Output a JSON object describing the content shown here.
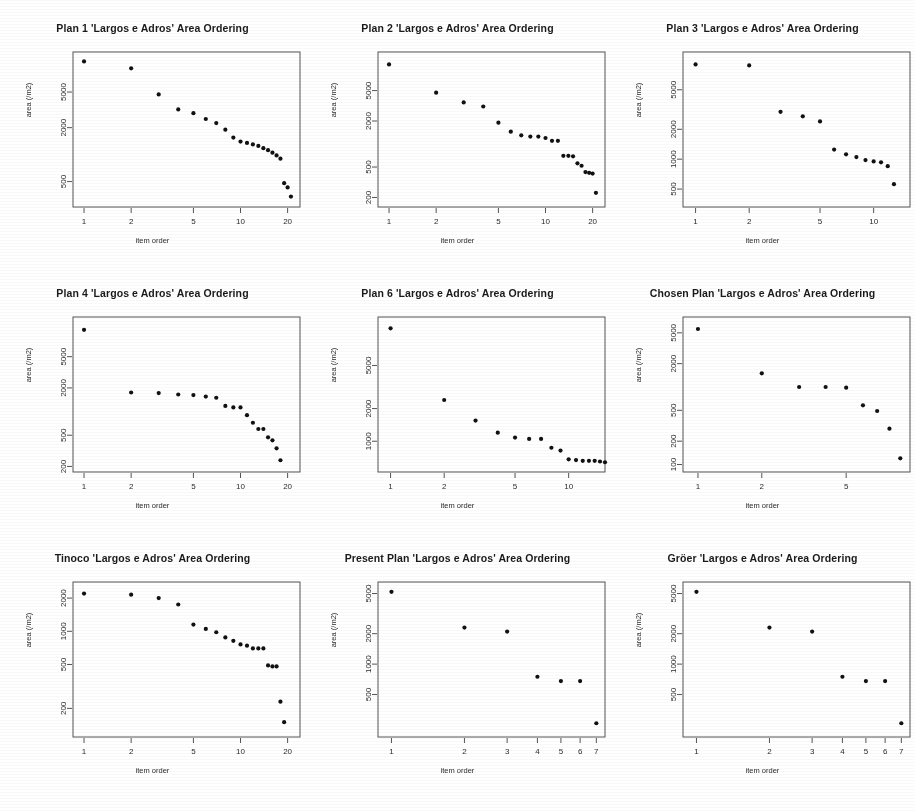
{
  "figure": {
    "n_panels": 9,
    "rows": 3,
    "columns": 3,
    "shared_xlabel": "item order",
    "shared_ylabel": "area (/m2)",
    "title_suffix": "'Largos e Adros' Area Ordering",
    "point_color": "#111111",
    "frame_color": "#555555",
    "background": "#ffffff",
    "caption": ""
  },
  "chart_data": [
    {
      "type": "scatter",
      "title": "Plan 1 'Largos e Adros' Area Ordering",
      "xlabel": "item order",
      "ylabel": "area (/m2)",
      "xscale": "log",
      "yscale": "log",
      "xticks": [
        1,
        2,
        5,
        10,
        20
      ],
      "yticks": [
        500,
        2000,
        5000
      ],
      "xlim": [
        0.85,
        24
      ],
      "ylim": [
        260,
        14000
      ],
      "x": [
        1,
        2,
        3,
        4,
        5,
        6,
        7,
        8,
        9,
        10,
        11,
        12,
        13,
        14,
        15,
        16,
        17,
        18,
        19,
        20,
        21
      ],
      "y": [
        11000,
        9200,
        4700,
        3200,
        2900,
        2500,
        2250,
        1900,
        1550,
        1400,
        1350,
        1300,
        1250,
        1180,
        1120,
        1050,
        980,
        900,
        480,
        430,
        340
      ]
    },
    {
      "type": "scatter",
      "title": "Plan 2 'Largos e Adros' Area Ordering",
      "xlabel": "item order",
      "ylabel": "area (/m2)",
      "xscale": "log",
      "yscale": "log",
      "xticks": [
        1,
        2,
        5,
        10,
        20
      ],
      "yticks": [
        200,
        500,
        2000,
        5000
      ],
      "xlim": [
        0.85,
        24
      ],
      "ylim": [
        150,
        16000
      ],
      "x": [
        1,
        2,
        3,
        4,
        5,
        6,
        7,
        8,
        9,
        10,
        11,
        12,
        13,
        14,
        15,
        16,
        17,
        18,
        19,
        20,
        21
      ],
      "y": [
        11000,
        4700,
        3500,
        3100,
        1900,
        1450,
        1300,
        1250,
        1250,
        1200,
        1100,
        1100,
        700,
        700,
        690,
        560,
        520,
        430,
        420,
        410,
        230
      ]
    },
    {
      "type": "scatter",
      "title": "Plan 3 'Largos e Adros' Area Ordering",
      "xlabel": "item order",
      "ylabel": "area (/m2)",
      "xscale": "log",
      "yscale": "log",
      "xticks": [
        1,
        2,
        5,
        10
      ],
      "yticks": [
        500,
        1000,
        2000,
        5000
      ],
      "xlim": [
        0.85,
        16
      ],
      "ylim": [
        330,
        12000
      ],
      "x": [
        1,
        2,
        3,
        4,
        5,
        6,
        7,
        8,
        9,
        10,
        11,
        12,
        13
      ],
      "y": [
        9000,
        8800,
        3000,
        2700,
        2400,
        1250,
        1120,
        1050,
        980,
        950,
        930,
        850,
        560
      ]
    },
    {
      "type": "scatter",
      "title": "Plan 4 'Largos e Adros' Area Ordering",
      "xlabel": "item order",
      "ylabel": "area (/m2)",
      "xscale": "log",
      "yscale": "log",
      "xticks": [
        1,
        2,
        5,
        10,
        20
      ],
      "yticks": [
        200,
        500,
        2000,
        5000
      ],
      "xlim": [
        0.85,
        24
      ],
      "ylim": [
        170,
        16000
      ],
      "x": [
        1,
        2,
        3,
        4,
        5,
        6,
        7,
        8,
        9,
        10,
        11,
        12,
        13,
        14,
        15,
        16,
        17,
        18
      ],
      "y": [
        11000,
        1750,
        1720,
        1650,
        1620,
        1550,
        1500,
        1180,
        1130,
        1130,
        900,
        720,
        600,
        600,
        470,
        430,
        340,
        240
      ]
    },
    {
      "type": "scatter",
      "title": "Plan 6 'Largos e Adros' Area Ordering",
      "xlabel": "item order",
      "ylabel": "area (/m2)",
      "xscale": "log",
      "yscale": "log",
      "xticks": [
        1,
        2,
        5,
        10
      ],
      "yticks": [
        1000,
        2000,
        5000
      ],
      "xlim": [
        0.85,
        16
      ],
      "ylim": [
        520,
        14000
      ],
      "x": [
        1,
        2,
        3,
        4,
        5,
        6,
        7,
        8,
        9,
        10,
        11,
        12,
        13,
        14,
        15,
        16
      ],
      "y": [
        11000,
        2400,
        1550,
        1200,
        1080,
        1050,
        1050,
        870,
        820,
        680,
        670,
        660,
        660,
        660,
        650,
        640
      ]
    },
    {
      "type": "scatter",
      "title": "Chosen Plan 'Largos e Adros' Area Ordering",
      "xlabel": "item order",
      "ylabel": "area (/m2)",
      "xscale": "log",
      "yscale": "log",
      "xticks": [
        1,
        2,
        5
      ],
      "yticks": [
        100,
        200,
        500,
        2000,
        5000
      ],
      "xlim": [
        0.85,
        10
      ],
      "ylim": [
        80,
        8000
      ],
      "x": [
        1,
        2,
        3,
        4,
        5,
        6,
        7,
        8,
        9
      ],
      "y": [
        5600,
        1500,
        1000,
        1000,
        980,
        580,
        490,
        290,
        120
      ]
    },
    {
      "type": "scatter",
      "title": "Tinoco 'Largos e Adros' Area Ordering",
      "xlabel": "item order",
      "ylabel": "area (/m2)",
      "xscale": "log",
      "yscale": "log",
      "xticks": [
        1,
        2,
        5,
        10,
        20
      ],
      "yticks": [
        200,
        500,
        1000,
        2000
      ],
      "xlim": [
        0.85,
        24
      ],
      "ylim": [
        110,
        2800
      ],
      "x": [
        1,
        2,
        3,
        4,
        5,
        6,
        7,
        8,
        9,
        10,
        11,
        12,
        13,
        14,
        15,
        16,
        17,
        18,
        19
      ],
      "y": [
        2200,
        2150,
        2000,
        1750,
        1150,
        1050,
        980,
        880,
        820,
        760,
        740,
        700,
        700,
        700,
        490,
        480,
        480,
        230,
        150
      ]
    },
    {
      "type": "scatter",
      "title": "Present Plan 'Largos e Adros' Area Ordering",
      "xlabel": "item order",
      "ylabel": "area (/m2)",
      "xscale": "log",
      "yscale": "log",
      "xticks": [
        1,
        2,
        3,
        4,
        5,
        6,
        7
      ],
      "yticks": [
        500,
        1000,
        2000,
        5000
      ],
      "xlim": [
        0.88,
        7.6
      ],
      "ylim": [
        190,
        6500
      ],
      "x": [
        1,
        2,
        3,
        4,
        5,
        6,
        7
      ],
      "y": [
        5200,
        2300,
        2100,
        750,
        680,
        680,
        260
      ]
    },
    {
      "type": "scatter",
      "title": "Gröer 'Largos e Adros' Area Ordering",
      "xlabel": "item order",
      "ylabel": "area (/m2)",
      "xscale": "log",
      "yscale": "log",
      "xticks": [
        1,
        2,
        3,
        4,
        5,
        6,
        7
      ],
      "yticks": [
        500,
        1000,
        2000,
        5000
      ],
      "xlim": [
        0.88,
        7.6
      ],
      "ylim": [
        190,
        6500
      ],
      "x": [
        1,
        2,
        3,
        4,
        5,
        6,
        7
      ],
      "y": [
        5200,
        2300,
        2100,
        750,
        680,
        680,
        260
      ]
    }
  ]
}
